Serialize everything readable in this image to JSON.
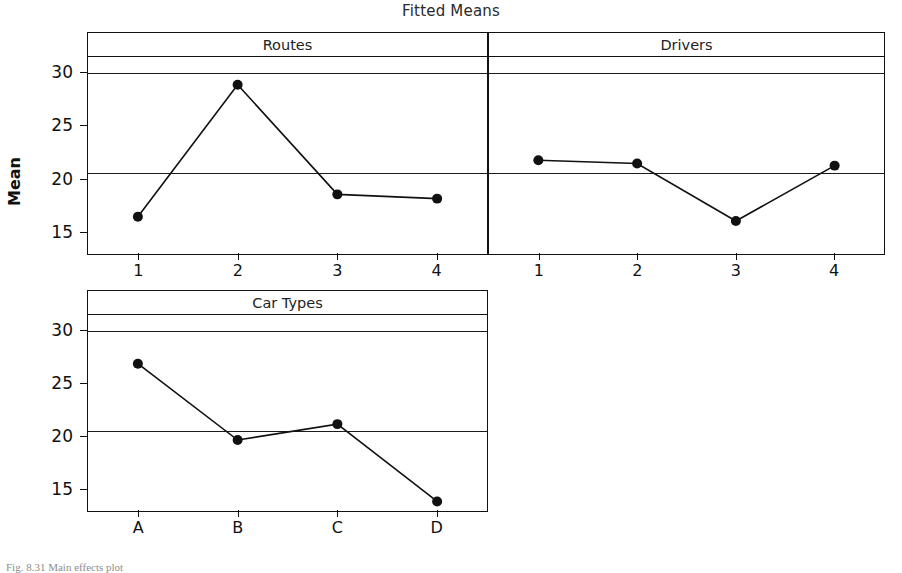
{
  "chart_data": {
    "type": "line",
    "title": "Fitted Means",
    "ylabel": "Mean",
    "xlabel": "",
    "ylim": [
      13.0,
      31.5
    ],
    "yticks": [
      15,
      20,
      25,
      30
    ],
    "ytick_labels": [
      "15",
      "20",
      "25",
      "30"
    ],
    "grid": false,
    "legend": "none",
    "reference_lines": [
      {
        "name": "grand-mean",
        "value": 20.6
      },
      {
        "name": "upper-line",
        "value": 30.0
      }
    ],
    "panels": [
      {
        "name": "routes",
        "label": "Routes",
        "categories": [
          "1",
          "2",
          "3",
          "4"
        ],
        "values": [
          16.5,
          28.9,
          18.6,
          18.2
        ]
      },
      {
        "name": "drivers",
        "label": "Drivers",
        "categories": [
          "1",
          "2",
          "3",
          "4"
        ],
        "values": [
          21.8,
          21.5,
          16.1,
          21.3
        ]
      },
      {
        "name": "car-types",
        "label": "Car Types",
        "categories": [
          "A",
          "B",
          "C",
          "D"
        ],
        "values": [
          26.9,
          19.7,
          21.2,
          13.9
        ]
      }
    ],
    "marker": "filled-circle",
    "marker_color": "#111111",
    "line_color": "#111111"
  },
  "caption": {
    "text": "Fig. 8.31  Main effects plot"
  },
  "colors": {
    "ink": "#111111",
    "background": "#ffffff"
  }
}
